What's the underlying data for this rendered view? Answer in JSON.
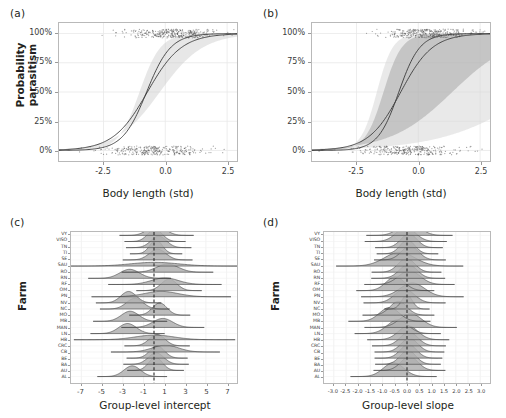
{
  "figure": {
    "panels": [
      {
        "letter": "(a)",
        "xlabel": "Body length (std)",
        "ylabel": "Probability parasitism"
      },
      {
        "letter": "(b)",
        "xlabel": "Body length (std)",
        "ylabel": ""
      },
      {
        "letter": "(c)",
        "xlabel": "Group-level intercept",
        "ylabel": "Farm"
      },
      {
        "letter": "(d)",
        "xlabel": "Group-level slope",
        "ylabel": "Farm"
      }
    ]
  },
  "chart_data": [
    {
      "type": "line",
      "panel": "(a)",
      "title": "",
      "xlabel": "Body length (std)",
      "ylabel": "Probability parasitism",
      "xlim": [
        -4.3,
        2.9
      ],
      "ylim": [
        -0.09,
        1.09
      ],
      "xticks": [
        -2.5,
        0.0,
        2.5
      ],
      "xtick_labels": [
        "-2.5",
        "0.0",
        "2.5"
      ],
      "yticks": [
        0,
        0.25,
        0.5,
        0.75,
        1.0
      ],
      "ytick_labels": [
        "0%",
        "25%",
        "50%",
        "75%",
        "100%"
      ],
      "grid": true,
      "legend": "none",
      "ribbon_color": "#c9c9c9",
      "line_color": "#3a3a3a",
      "point_color": "#555555",
      "series": [
        {
          "name": "fitted-curve-1",
          "type": "logistic",
          "intercept": 1.55,
          "slope": 2.05
        },
        {
          "name": "fitted-curve-2",
          "type": "logistic",
          "intercept": 1.05,
          "slope": 1.45
        }
      ],
      "ribbons": [
        {
          "name": "credible-interval",
          "lower_intercept": 0.25,
          "lower_slope": 1.15,
          "upper_intercept": 2.45,
          "upper_slope": 2.35,
          "opacity": 0.45
        }
      ],
      "rug_top_value": 1.0,
      "rug_bottom_value": 0.0,
      "n_points_top": 330,
      "n_points_bottom": 300
    },
    {
      "type": "line",
      "panel": "(b)",
      "title": "",
      "xlabel": "Body length (std)",
      "ylabel": "",
      "xlim": [
        -4.3,
        2.9
      ],
      "ylim": [
        -0.09,
        1.09
      ],
      "xticks": [
        -2.5,
        0.0,
        2.5
      ],
      "xtick_labels": [
        "-2.5",
        "0.0",
        "2.5"
      ],
      "yticks": [
        0,
        0.25,
        0.5,
        0.75,
        1.0
      ],
      "ytick_labels": [
        "0%",
        "25%",
        "50%",
        "75%",
        "100%"
      ],
      "grid": true,
      "legend": "none",
      "ribbon_inner_color": "#a8a8a8",
      "ribbon_outer_color": "#d4d4d4",
      "line_color": "#3a3a3a",
      "point_color": "#555555",
      "series": [
        {
          "name": "fitted-curve-1",
          "type": "logistic",
          "intercept": 1.85,
          "slope": 2.35
        },
        {
          "name": "fitted-curve-2",
          "type": "logistic",
          "intercept": 1.1,
          "slope": 1.55
        }
      ],
      "ribbons": [
        {
          "name": "outer-credible-interval",
          "lower_intercept": -2.6,
          "lower_slope": 0.55,
          "upper_intercept": 5.2,
          "upper_slope": 3.1,
          "opacity": 0.5
        },
        {
          "name": "inner-credible-interval",
          "lower_intercept": -1.1,
          "lower_slope": 0.8,
          "upper_intercept": 3.8,
          "upper_slope": 2.7,
          "opacity": 0.55
        }
      ],
      "rug_top_value": 1.0,
      "rug_bottom_value": 0.0,
      "n_points_top": 330,
      "n_points_bottom": 300
    },
    {
      "type": "ridgeline",
      "panel": "(c)",
      "title": "",
      "xlabel": "Group-level intercept",
      "ylabel": "Farm",
      "xlim": [
        -8.0,
        8.0
      ],
      "xticks": [
        -7,
        -5,
        -3,
        -1,
        1,
        3,
        5,
        7
      ],
      "xtick_labels": [
        "-7",
        "-5",
        "-3",
        "-1",
        "1",
        "3",
        "5",
        "7"
      ],
      "grid": true,
      "reference_line": 0,
      "fill_color": "#b0b0b0",
      "line_color": "#333333",
      "categories": [
        "VY",
        "VISO",
        "TN",
        "TI",
        "SE",
        "SAU",
        "RO",
        "RN",
        "RF",
        "OM",
        "PN",
        "NV",
        "NC",
        "MO",
        "MB",
        "MAN",
        "LN",
        "HB",
        "CRC",
        "CB",
        "BE",
        "BA",
        "AU",
        "AL"
      ],
      "distributions": [
        {
          "farm": "VY",
          "mean": 0.25,
          "sd": 0.85
        },
        {
          "farm": "VISO",
          "mean": 0.1,
          "sd": 0.7
        },
        {
          "farm": "TN",
          "mean": 0.45,
          "sd": 0.75
        },
        {
          "farm": "TI",
          "mean": 0.2,
          "sd": 0.6
        },
        {
          "farm": "SE",
          "mean": 0.35,
          "sd": 0.8
        },
        {
          "farm": "SAU",
          "mean": 0.05,
          "sd": 2.3
        },
        {
          "farm": "RO",
          "mean": 1.3,
          "sd": 1.05
        },
        {
          "farm": "RN",
          "mean": -2.35,
          "sd": 0.95
        },
        {
          "farm": "RF",
          "mean": 1.05,
          "sd": 1.3
        },
        {
          "farm": "OM",
          "mean": 1.45,
          "sd": 0.75
        },
        {
          "farm": "PN",
          "mean": 0.7,
          "sd": 1.6
        },
        {
          "farm": "NV",
          "mean": -2.45,
          "sd": 0.75
        },
        {
          "farm": "NC",
          "mean": -1.85,
          "sd": 0.8
        },
        {
          "farm": "MO",
          "mean": 0.55,
          "sd": 0.7
        },
        {
          "farm": "MB",
          "mean": -2.3,
          "sd": 0.85
        },
        {
          "farm": "MAN",
          "mean": 0.85,
          "sd": 0.95
        },
        {
          "farm": "LN",
          "mean": -2.55,
          "sd": 0.85
        },
        {
          "farm": "HB",
          "mean": 0.05,
          "sd": 1.85
        },
        {
          "farm": "CRC",
          "mean": 0.3,
          "sd": 0.75
        },
        {
          "farm": "CB",
          "mean": 1.1,
          "sd": 1.25
        },
        {
          "farm": "BE",
          "mean": 0.3,
          "sd": 0.7
        },
        {
          "farm": "BA",
          "mean": 0.2,
          "sd": 0.75
        },
        {
          "farm": "AU",
          "mean": 0.15,
          "sd": 0.65
        },
        {
          "farm": "AL",
          "mean": -2.1,
          "sd": 0.8
        }
      ]
    },
    {
      "type": "ridgeline",
      "panel": "(d)",
      "title": "",
      "xlabel": "Group-level slope",
      "ylabel": "Farm",
      "xlim": [
        -3.4,
        3.4
      ],
      "xticks": [
        -3.0,
        -2.5,
        -2.0,
        -1.5,
        -1.0,
        -0.5,
        0.0,
        0.5,
        1.0,
        1.5,
        2.0,
        2.5,
        3.0
      ],
      "xtick_labels": [
        "-3.0",
        "-2.5",
        "-2.0",
        "-1.5",
        "-1.0",
        "-0.5",
        "0.0",
        "0.5",
        "1.0",
        "1.5",
        "2.0",
        "2.5",
        "3.0"
      ],
      "grid": true,
      "reference_line": 0,
      "fill_color": "#b0b0b0",
      "line_color": "#333333",
      "categories": [
        "VY",
        "VISO",
        "TN",
        "TI",
        "SE",
        "SAU",
        "RO",
        "RN",
        "RF",
        "OM",
        "PN",
        "NV",
        "NC",
        "MO",
        "MB",
        "MAN",
        "LN",
        "HB",
        "CRC",
        "CB",
        "BE",
        "BA",
        "AU",
        "AL"
      ],
      "distributions": [
        {
          "farm": "VY",
          "mean": 0.1,
          "sd": 0.42
        },
        {
          "farm": "VISO",
          "mean": -0.05,
          "sd": 0.4
        },
        {
          "farm": "TN",
          "mean": 0.08,
          "sd": 0.33
        },
        {
          "farm": "TI",
          "mean": 0.02,
          "sd": 0.3
        },
        {
          "farm": "SE",
          "mean": 0.12,
          "sd": 0.35
        },
        {
          "farm": "SAU",
          "mean": -0.3,
          "sd": 0.62
        },
        {
          "farm": "RO",
          "mean": -0.02,
          "sd": 0.34
        },
        {
          "farm": "RN",
          "mean": 0.05,
          "sd": 0.36
        },
        {
          "farm": "RF",
          "mean": 0.1,
          "sd": 0.44
        },
        {
          "farm": "OM",
          "mean": -0.48,
          "sd": 0.38
        },
        {
          "farm": "PN",
          "mean": 0.22,
          "sd": 0.5
        },
        {
          "farm": "NV",
          "mean": -0.1,
          "sd": 0.4
        },
        {
          "farm": "NC",
          "mean": 0.0,
          "sd": 0.22
        },
        {
          "farm": "MO",
          "mean": -0.35,
          "sd": 0.35
        },
        {
          "farm": "MB",
          "mean": -0.72,
          "sd": 0.4
        },
        {
          "farm": "MAN",
          "mean": 0.15,
          "sd": 0.45
        },
        {
          "farm": "LN",
          "mean": -0.38,
          "sd": 0.42
        },
        {
          "farm": "HB",
          "mean": 0.05,
          "sd": 0.4
        },
        {
          "farm": "CRC",
          "mean": 0.08,
          "sd": 0.36
        },
        {
          "farm": "CB",
          "mean": 0.1,
          "sd": 0.34
        },
        {
          "farm": "BE",
          "mean": 0.06,
          "sd": 0.33
        },
        {
          "farm": "BA",
          "mean": 0.04,
          "sd": 0.32
        },
        {
          "farm": "AU",
          "mean": 0.1,
          "sd": 0.35
        },
        {
          "farm": "AL",
          "mean": -0.55,
          "sd": 0.42
        }
      ]
    }
  ]
}
